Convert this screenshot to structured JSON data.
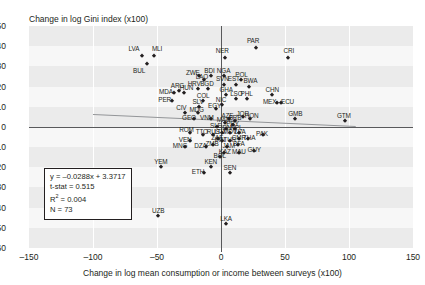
{
  "chart_data": {
    "type": "scatter",
    "title": "Change in log Gini index (x100)",
    "xlabel": "Change in log mean consumption or income between surveys (x100)",
    "ylabel": "Change in log Gini index (x100)",
    "xlim": [
      -150,
      150
    ],
    "ylim": [
      -60,
      50
    ],
    "xticks": [
      -150,
      -100,
      -50,
      0,
      50,
      100,
      150
    ],
    "yticks": [
      50,
      40,
      30,
      20,
      10,
      0,
      -10,
      -20,
      -30,
      -40,
      -50,
      -60
    ],
    "grid": "horizontal-bands",
    "legend": "none",
    "regression": {
      "equation": "y = –0.0288x + 3.3717",
      "tstat_label": "t-stat = 0.515",
      "r2_label": "R",
      "r2_sup": "2",
      "r2_value": " = 0.004",
      "n_label": "N = 73",
      "slope": -0.0288,
      "intercept": 3.3717,
      "t_stat": 0.515,
      "r_squared": 0.004,
      "n": 73,
      "line_x_start": -100,
      "line_x_end": 105
    },
    "points": [
      {
        "label": "LVA",
        "x": -62,
        "y": 35,
        "lx": -68,
        "ly": 39
      },
      {
        "label": "MLI",
        "x": -52,
        "y": 35,
        "lx": -50,
        "ly": 39
      },
      {
        "label": "BUL",
        "x": -58,
        "y": 31,
        "lx": -64,
        "ly": 28
      },
      {
        "label": "NER",
        "x": 3,
        "y": 34,
        "lx": 1,
        "ly": 38
      },
      {
        "label": "PAR",
        "x": 27,
        "y": 39,
        "lx": 25,
        "ly": 43
      },
      {
        "label": "CRI",
        "x": 52,
        "y": 34,
        "lx": 53,
        "ly": 38
      },
      {
        "label": "ZWE",
        "x": -17,
        "y": 25,
        "lx": -22,
        "ly": 27
      },
      {
        "label": "BDI",
        "x": -8,
        "y": 25,
        "lx": -9,
        "ly": 28
      },
      {
        "label": "LAO",
        "x": -13,
        "y": 23,
        "lx": -15,
        "ly": 25
      },
      {
        "label": "NGA",
        "x": 2,
        "y": 25,
        "lx": 2,
        "ly": 28
      },
      {
        "label": "POL",
        "x": 16,
        "y": 23,
        "lx": 16,
        "ly": 26
      },
      {
        "label": "SVN",
        "x": 2,
        "y": 21,
        "lx": 1,
        "ly": 24
      },
      {
        "label": "EST",
        "x": 12,
        "y": 21,
        "lx": 10,
        "ly": 24
      },
      {
        "label": "BWA",
        "x": 22,
        "y": 20,
        "lx": 23,
        "ly": 23
      },
      {
        "label": "HRV",
        "x": -18,
        "y": 19,
        "lx": -21,
        "ly": 22
      },
      {
        "label": "BGD",
        "x": -10,
        "y": 19,
        "lx": -11,
        "ly": 22
      },
      {
        "label": "MDA",
        "x": -37,
        "y": 17,
        "lx": -43,
        "ly": 18
      },
      {
        "label": "ARG",
        "x": -33,
        "y": 18,
        "lx": -34,
        "ly": 21
      },
      {
        "label": "HUN",
        "x": -29,
        "y": 17,
        "lx": -27,
        "ly": 20
      },
      {
        "label": "PER",
        "x": -38,
        "y": 13,
        "lx": -44,
        "ly": 14
      },
      {
        "label": "GHA",
        "x": 4,
        "y": 16,
        "lx": 4,
        "ly": 19
      },
      {
        "label": "LSO",
        "x": 12,
        "y": 14,
        "lx": 12,
        "ly": 17
      },
      {
        "label": "PHL",
        "x": 20,
        "y": 14,
        "lx": 20,
        "ly": 17
      },
      {
        "label": "CHN",
        "x": 40,
        "y": 16,
        "lx": 40,
        "ly": 19
      },
      {
        "label": "MEX",
        "x": 44,
        "y": 12,
        "lx": 38,
        "ly": 13
      },
      {
        "label": "ECU",
        "x": 47,
        "y": 12,
        "lx": 52,
        "ly": 13
      },
      {
        "label": "COL",
        "x": -14,
        "y": 13,
        "lx": -14,
        "ly": 16
      },
      {
        "label": "SLV",
        "x": -17,
        "y": 10,
        "lx": -18,
        "ly": 13
      },
      {
        "label": "NIC",
        "x": 1,
        "y": 11,
        "lx": 0,
        "ly": 14
      },
      {
        "label": "CIV",
        "x": -28,
        "y": 7,
        "lx": -31,
        "ly": 10
      },
      {
        "label": "MDG",
        "x": -18,
        "y": 7,
        "lx": -19,
        "ly": 9
      },
      {
        "label": "EGY",
        "x": -4,
        "y": 9,
        "lx": -5,
        "ly": 11
      },
      {
        "label": "GEO",
        "x": -21,
        "y": 4,
        "lx": -25,
        "ly": 5
      },
      {
        "label": "VNM",
        "x": -8,
        "y": 4,
        "lx": -11,
        "ly": 5
      },
      {
        "label": "GMB",
        "x": 58,
        "y": 4,
        "lx": 58,
        "ly": 7
      },
      {
        "label": "GTM",
        "x": 97,
        "y": 3,
        "lx": 96,
        "ly": 6
      },
      {
        "label": "AZE",
        "x": 6,
        "y": 4,
        "lx": 5,
        "ly": 6
      },
      {
        "label": "JOR",
        "x": 17,
        "y": 5,
        "lx": 17,
        "ly": 7
      },
      {
        "label": "HON",
        "x": 23,
        "y": 4,
        "lx": 24,
        "ly": 6
      },
      {
        "label": "BRB",
        "x": 11,
        "y": 3,
        "lx": 11,
        "ly": 5
      },
      {
        "label": "MAR",
        "x": 3,
        "y": 2,
        "lx": 2,
        "ly": 4
      },
      {
        "label": "ROM",
        "x": -24,
        "y": -3,
        "lx": -27,
        "ly": -1
      },
      {
        "label": "TTO",
        "x": -14,
        "y": -4,
        "lx": -15,
        "ly": -2
      },
      {
        "label": "RUS",
        "x": -6,
        "y": -4,
        "lx": -6,
        "ly": -2
      },
      {
        "label": "LTU",
        "x": 1,
        "y": -3,
        "lx": -1,
        "ly": -2
      },
      {
        "label": "MDV",
        "x": 7,
        "y": -3,
        "lx": 7,
        "ly": -2
      },
      {
        "label": "LVA2",
        "x": 14,
        "y": -3,
        "lx": 15,
        "ly": -2
      },
      {
        "label": "PAK",
        "x": 33,
        "y": -4,
        "lx": 32,
        "ly": -3
      },
      {
        "label": "VEN",
        "x": -24,
        "y": -7,
        "lx": -28,
        "ly": -6
      },
      {
        "label": "ZAF",
        "x": -2,
        "y": -6,
        "lx": -3,
        "ly": -5
      },
      {
        "label": "IRN",
        "x": 1,
        "y": -7,
        "lx": -1,
        "ly": -6
      },
      {
        "label": "TUR",
        "x": 7,
        "y": -7,
        "lx": 7,
        "ly": -6
      },
      {
        "label": "CMR",
        "x": 14,
        "y": -6,
        "lx": 14,
        "ly": -5
      },
      {
        "label": "THA",
        "x": 21,
        "y": -6,
        "lx": 22,
        "ly": -5
      },
      {
        "label": "MNG",
        "x": -28,
        "y": -10,
        "lx": -32,
        "ly": -9
      },
      {
        "label": "DZA",
        "x": -12,
        "y": -10,
        "lx": -16,
        "ly": -9
      },
      {
        "label": "ZMB",
        "x": -6,
        "y": -9,
        "lx": -7,
        "ly": -8
      },
      {
        "label": "JAM",
        "x": 5,
        "y": -10,
        "lx": 6,
        "ly": -9
      },
      {
        "label": "BFA",
        "x": 13,
        "y": -9,
        "lx": 14,
        "ly": -8
      },
      {
        "label": "KAZ",
        "x": 2,
        "y": -13,
        "lx": 3,
        "ly": -12
      },
      {
        "label": "MAU",
        "x": 14,
        "y": -13,
        "lx": 14,
        "ly": -12
      },
      {
        "label": "GUY",
        "x": 26,
        "y": -12,
        "lx": 26,
        "ly": -11
      },
      {
        "label": "BOL",
        "x": -1,
        "y": -15,
        "lx": -1,
        "ly": -14
      },
      {
        "label": "YEM",
        "x": -47,
        "y": -20,
        "lx": -47,
        "ly": -17
      },
      {
        "label": "KEN",
        "x": -8,
        "y": -20,
        "lx": -8,
        "ly": -17
      },
      {
        "label": "ETH",
        "x": -13,
        "y": -23,
        "lx": -18,
        "ly": -22
      },
      {
        "label": "SEN",
        "x": 7,
        "y": -23,
        "lx": 7,
        "ly": -20
      },
      {
        "label": "UZB",
        "x": -49,
        "y": -44,
        "lx": -49,
        "ly": -41
      },
      {
        "label": "LKA",
        "x": 4,
        "y": -48,
        "lx": 4,
        "ly": -45
      },
      {
        "label": "PRY",
        "x": 9,
        "y": 1,
        "lx": 9,
        "ly": 2
      },
      {
        "label": "SLE",
        "x": -3,
        "y": 0,
        "lx": -4,
        "ly": 1
      },
      {
        "label": "NPL",
        "x": 11,
        "y": -1,
        "lx": 12,
        "ly": 0
      },
      {
        "label": "IDN",
        "x": 4,
        "y": -1,
        "lx": 4,
        "ly": 0
      }
    ]
  }
}
